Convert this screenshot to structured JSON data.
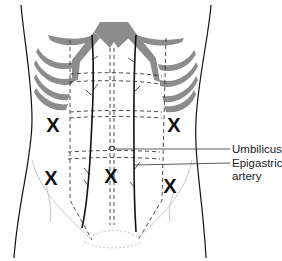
{
  "diagram": {
    "colors": {
      "bone": "#8c8c8c",
      "outline": "#111111",
      "dashed": "#222222",
      "faint": "#c8c8c8"
    },
    "labels": [
      {
        "id": "umbilicus",
        "text": "Umbilicus"
      },
      {
        "id": "epigastric",
        "line1": "Epigastric",
        "line2": "artery"
      }
    ],
    "markers": [
      {
        "symbol": "X",
        "x": 53,
        "y": 125
      },
      {
        "symbol": "X",
        "x": 174,
        "y": 125
      },
      {
        "symbol": "X",
        "x": 51,
        "y": 178
      },
      {
        "symbol": "X",
        "x": 111,
        "y": 176
      },
      {
        "symbol": "X",
        "x": 170,
        "y": 186
      }
    ]
  }
}
